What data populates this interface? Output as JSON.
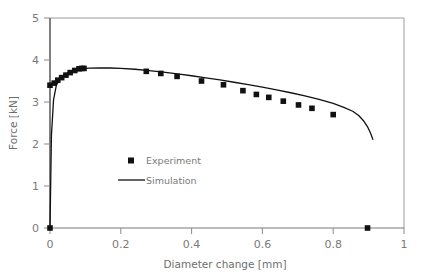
{
  "chart_data": {
    "type": "line",
    "title": "",
    "xlabel": "Diameter change [mm]",
    "ylabel": "Force [kN]",
    "xlim": [
      0,
      1
    ],
    "ylim": [
      0,
      5
    ],
    "xticks": [
      "0",
      "0.2",
      "0.4",
      "0.6",
      "0.8",
      "1"
    ],
    "xtick_values": [
      0,
      0.2,
      0.4,
      0.6,
      0.8,
      1
    ],
    "yticks": [
      "0",
      "1",
      "2",
      "3",
      "4",
      "5"
    ],
    "ytick_values": [
      0,
      1,
      2,
      3,
      4,
      5
    ],
    "grid": false,
    "legend_position": "center-left-inside",
    "series": [
      {
        "name": "Experiment",
        "type": "scatter",
        "marker": "square",
        "color": "#111111",
        "x": [
          0.0,
          0.0,
          0.012,
          0.022,
          0.033,
          0.045,
          0.057,
          0.07,
          0.082,
          0.09,
          0.096,
          0.272,
          0.313,
          0.359,
          0.428,
          0.49,
          0.545,
          0.583,
          0.618,
          0.659,
          0.702,
          0.74,
          0.8,
          0.897
        ],
        "y": [
          0.0,
          3.4,
          3.45,
          3.52,
          3.58,
          3.64,
          3.7,
          3.75,
          3.79,
          3.8,
          3.8,
          3.73,
          3.68,
          3.61,
          3.5,
          3.41,
          3.27,
          3.18,
          3.11,
          3.02,
          2.93,
          2.85,
          2.7,
          0.0
        ]
      },
      {
        "name": "Simulation",
        "type": "line",
        "color": "#111111",
        "x": [
          0.0,
          0.004,
          0.01,
          0.018,
          0.028,
          0.04,
          0.055,
          0.072,
          0.09,
          0.11,
          0.14,
          0.17,
          0.2,
          0.24,
          0.28,
          0.32,
          0.36,
          0.4,
          0.44,
          0.48,
          0.52,
          0.56,
          0.6,
          0.64,
          0.68,
          0.72,
          0.76,
          0.8,
          0.83,
          0.855,
          0.872,
          0.885,
          0.897,
          0.906,
          0.912
        ],
        "y": [
          0.0,
          2.2,
          3.05,
          3.4,
          3.55,
          3.65,
          3.72,
          3.77,
          3.79,
          3.805,
          3.81,
          3.81,
          3.8,
          3.78,
          3.745,
          3.71,
          3.67,
          3.625,
          3.575,
          3.525,
          3.47,
          3.415,
          3.355,
          3.29,
          3.22,
          3.145,
          3.06,
          2.965,
          2.87,
          2.78,
          2.68,
          2.56,
          2.41,
          2.25,
          2.11
        ]
      }
    ],
    "legend_entries": [
      {
        "label": "Experiment",
        "symbol": "square-marker",
        "color": "#111111"
      },
      {
        "label": "Simulation",
        "symbol": "line-sample",
        "color": "#111111"
      }
    ],
    "annotations": [
      {
        "text": "Experiment data markers drop to zero force at 0.897 mm (specimen failure)"
      }
    ]
  },
  "axes": {
    "frame_color": "#9a9a9a",
    "axis_line_color": "#4a4a4a"
  }
}
